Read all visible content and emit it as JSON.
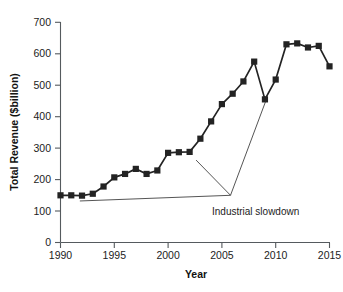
{
  "chart_data": {
    "type": "line",
    "title": "",
    "xlabel": "Year",
    "ylabel": "Total Revenue ($billion)",
    "xlim": [
      1990,
      2015
    ],
    "ylim": [
      0,
      700
    ],
    "xticks": [
      1990,
      1995,
      2000,
      2005,
      2010,
      2015
    ],
    "yticks": [
      0,
      100,
      200,
      300,
      400,
      500,
      600,
      700
    ],
    "grid": false,
    "legend": null,
    "marker": "square",
    "series_color": "#232323",
    "x": [
      1990,
      1991,
      1992,
      1993,
      1994,
      1995,
      1996,
      1997,
      1998,
      1999,
      2000,
      2001,
      2002,
      2003,
      2004,
      2005,
      2006,
      2007,
      2008,
      2009,
      2010,
      2011,
      2012,
      2013,
      2014,
      2015
    ],
    "values": [
      150,
      150,
      149,
      155,
      178,
      207,
      218,
      234,
      218,
      229,
      285,
      287,
      288,
      330,
      385,
      440,
      473,
      512,
      575,
      455,
      518,
      630,
      633,
      620,
      625,
      560
    ],
    "series": [
      {
        "name": "Total Revenue",
        "values": [
          150,
          150,
          149,
          155,
          178,
          207,
          218,
          234,
          218,
          229,
          285,
          287,
          288,
          330,
          385,
          440,
          473,
          512,
          575,
          455,
          518,
          630,
          633,
          620,
          625,
          560
        ]
      }
    ],
    "annotations": [
      {
        "label": "Industrial slowdown",
        "label_x": 2006.3,
        "label_y": 120,
        "anchor_x": 2005.8,
        "anchor_y": 150,
        "pointers": [
          {
            "x": 1991.8,
            "y": 132
          },
          {
            "x": 2002.6,
            "y": 262
          },
          {
            "x": 2009.1,
            "y": 452
          }
        ]
      }
    ]
  },
  "axis": {
    "x_tick_labels": [
      "1990",
      "1995",
      "2000",
      "2005",
      "2010",
      "2015"
    ],
    "y_tick_labels": [
      "0",
      "100",
      "200",
      "300",
      "400",
      "500",
      "600",
      "700"
    ],
    "x_title": "Year",
    "y_title": "Total Revenue ($billion)"
  },
  "annotation": {
    "text": "Industrial slowdown"
  }
}
